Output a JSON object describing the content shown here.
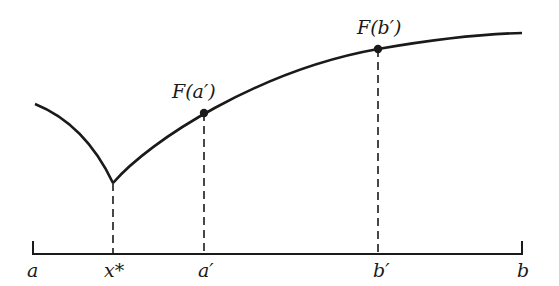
{
  "figure": {
    "type": "function-curve-diagram",
    "axis_labels": {
      "a": "a",
      "x_star": "x*",
      "a_prime": "a′",
      "b_prime": "b′",
      "b": "b"
    },
    "point_labels": {
      "f_a_prime": "F(a′)",
      "f_b_prime": "F(b′)"
    },
    "colors": {
      "ink": "#1a1a1a",
      "background": "#ffffff"
    }
  }
}
